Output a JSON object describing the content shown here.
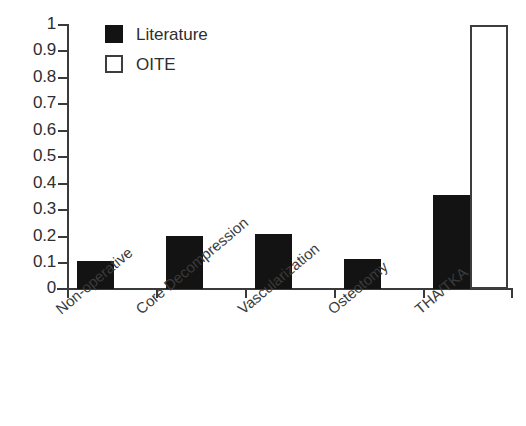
{
  "chart_data": {
    "type": "bar",
    "title": "",
    "subtitle": "",
    "xlabel": "",
    "ylabel": "",
    "ylim": [
      0,
      1
    ],
    "ytick_labels": [
      "1",
      "0.9",
      "0.8",
      "0.7",
      "0.6",
      "0.5",
      "0.4",
      "0.3",
      "0.2",
      "0.1",
      "0"
    ],
    "ytick_values": [
      1,
      0.9,
      0.8,
      0.7,
      0.6,
      0.5,
      0.4,
      0.3,
      0.2,
      0.1,
      0
    ],
    "grid": false,
    "legend_position": "top-left",
    "categories": [
      "Non-operative",
      "Core Decompression",
      "Vascularization",
      "Osteotomy",
      "THA/TKA"
    ],
    "series": [
      {
        "name": "Literature",
        "style": "filled",
        "color": "#131313",
        "values": [
          0.105,
          0.2,
          0.21,
          0.115,
          0.355
        ]
      },
      {
        "name": "OITE",
        "style": "outlined",
        "color": "#ffffff",
        "edge_color": "#3d3d3d",
        "values": [
          null,
          null,
          null,
          null,
          1.0
        ]
      }
    ]
  },
  "legend": {
    "entries": [
      {
        "label": "Literature",
        "swatch": "filled-square-swatch"
      },
      {
        "label": "OITE",
        "swatch": "outlined-square-swatch"
      }
    ]
  },
  "axes": {
    "y": {
      "ticks": [
        "1",
        "0.9",
        "0.8",
        "0.7",
        "0.6",
        "0.5",
        "0.4",
        "0.3",
        "0.2",
        "0.1",
        "0"
      ]
    },
    "x": {
      "ticks": [
        "Non-operative",
        "Core Decompression",
        "Vascularization",
        "Osteotomy",
        "THA/TKA"
      ]
    }
  },
  "colors": {
    "literature": "#131313",
    "oite_fill": "#ffffff",
    "oite_edge": "#3d3d3d",
    "axis": "#3a3a3a",
    "text": "#2e2e2e",
    "background": "#ffffff"
  }
}
